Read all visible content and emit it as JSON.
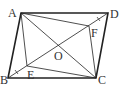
{
  "diagram": {
    "type": "geometry",
    "shape": "parallelogram ABCD with diagonals intersecting at O; points E and F on diagonal BD",
    "points": {
      "A": {
        "label": "A",
        "x": 21,
        "y": 13,
        "lx": 8,
        "ly": 17
      },
      "D": {
        "label": "D",
        "x": 108,
        "y": 13,
        "lx": 111,
        "ly": 18
      },
      "B": {
        "label": "B",
        "x": 8,
        "y": 78,
        "lx": 0,
        "ly": 84
      },
      "C": {
        "label": "C",
        "x": 96,
        "y": 78,
        "lx": 99,
        "ly": 84
      },
      "O": {
        "label": "O",
        "x": 58,
        "y": 45,
        "lx": 54,
        "ly": 60
      },
      "E": {
        "label": "E",
        "x": 27,
        "y": 66,
        "lx": 27,
        "ly": 79
      },
      "F": {
        "label": "F",
        "x": 89,
        "y": 26,
        "lx": 91,
        "ly": 37
      }
    },
    "segments": [
      "AB",
      "BC",
      "CD",
      "DA",
      "AC",
      "BD",
      "AE",
      "EC",
      "AF",
      "FC"
    ],
    "tick_marks": [
      "BE",
      "DF"
    ]
  }
}
